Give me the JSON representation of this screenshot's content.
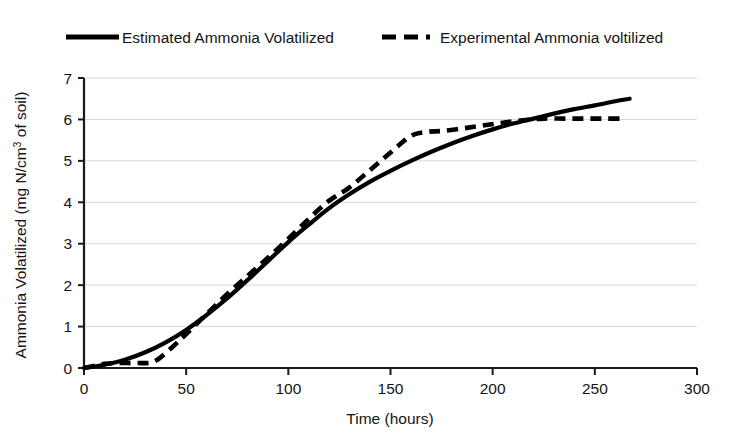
{
  "chart_data": {
    "type": "line",
    "title": "",
    "xlabel": "Time (hours)",
    "ylabel": "Ammonia Volatilized (mg N/cm3 of soil)",
    "ylabel_main": "Ammonia Volatilized (mg N/cm",
    "ylabel_sup": "3",
    "ylabel_tail": " of soil)",
    "xlim": [
      0,
      300
    ],
    "ylim": [
      0,
      7
    ],
    "xticks": [
      0,
      50,
      100,
      150,
      200,
      250,
      300
    ],
    "xtick_labels": [
      "0",
      "50",
      "100",
      "150",
      "200",
      "250",
      "300"
    ],
    "yticks": [
      0,
      1,
      2,
      3,
      4,
      5,
      6,
      7
    ],
    "ytick_labels": [
      "0",
      "1",
      "2",
      "3",
      "4",
      "5",
      "6",
      "7"
    ],
    "grid": "horizontal",
    "grid_color": "#d9d9d9",
    "axis_color": "#1a1a1a",
    "legend_position": "top",
    "series": [
      {
        "name": "Estimated Ammonia Volatilized",
        "style": "solid",
        "color": "#000000",
        "x": [
          0,
          10,
          20,
          30,
          40,
          50,
          60,
          70,
          80,
          90,
          100,
          110,
          120,
          130,
          140,
          150,
          160,
          170,
          180,
          190,
          200,
          210,
          220,
          230,
          240,
          250,
          260,
          267
        ],
        "y": [
          0.0,
          0.08,
          0.2,
          0.38,
          0.62,
          0.92,
          1.28,
          1.68,
          2.12,
          2.58,
          3.04,
          3.46,
          3.86,
          4.2,
          4.5,
          4.76,
          5.0,
          5.22,
          5.42,
          5.6,
          5.76,
          5.9,
          6.02,
          6.14,
          6.25,
          6.34,
          6.44,
          6.5
        ]
      },
      {
        "name": "Experimental Ammonia voltilized",
        "style": "dashed",
        "color": "#000000",
        "x": [
          0,
          10,
          18,
          26,
          34,
          42,
          50,
          60,
          70,
          80,
          90,
          100,
          110,
          120,
          130,
          140,
          150,
          160,
          168,
          175,
          185,
          195,
          205,
          215,
          225,
          235,
          245,
          255,
          265
        ],
        "y": [
          0.0,
          0.1,
          0.12,
          0.12,
          0.15,
          0.45,
          0.82,
          1.3,
          1.78,
          2.22,
          2.66,
          3.12,
          3.6,
          4.04,
          4.36,
          4.78,
          5.2,
          5.6,
          5.7,
          5.72,
          5.78,
          5.85,
          5.92,
          5.98,
          6.02,
          6.02,
          6.02,
          6.02,
          6.02
        ]
      }
    ]
  },
  "legend": {
    "items": [
      {
        "label": "Estimated Ammonia Volatilized",
        "style": "solid"
      },
      {
        "label": "Experimental Ammonia voltilized",
        "style": "dashed"
      }
    ]
  }
}
